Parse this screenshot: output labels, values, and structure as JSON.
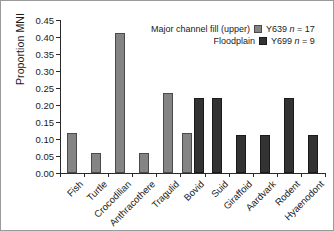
{
  "chart_data": {
    "type": "bar",
    "title": "",
    "xlabel": "",
    "ylabel": "Proportion MNI",
    "ylim": [
      0,
      0.45
    ],
    "ytick_step": 0.05,
    "ytick_labels": [
      "0.00",
      "0.05",
      "0.10",
      "0.15",
      "0.20",
      "0.25",
      "0.30",
      "0.35",
      "0.40",
      "0.45"
    ],
    "grid": false,
    "legend_position": "top-right",
    "categories": [
      "Fish",
      "Turtle",
      "Crocodilian",
      "Anthracothere",
      "Tragulid",
      "Bovid",
      "Suid",
      "Giraffoid",
      "Aardvark",
      "Rodent",
      "Hyaenodont"
    ],
    "series": [
      {
        "name": "Y639",
        "description": "Major channel fill (upper)",
        "n_label": "n = 17",
        "n": 17,
        "color": "#848484",
        "values": [
          0.118,
          0.059,
          0.412,
          0.059,
          0.235,
          0.118,
          0.0,
          0.0,
          0.0,
          0.0,
          0.0
        ]
      },
      {
        "name": "Y699",
        "description": "Floodplain",
        "n_label": "n = 9",
        "n": 9,
        "color": "#333333",
        "values": [
          0.0,
          0.0,
          0.0,
          0.0,
          0.0,
          0.222,
          0.222,
          0.111,
          0.111,
          0.222,
          0.111
        ]
      }
    ]
  },
  "legend": {
    "rows": [
      {
        "desc": "Major channel fill (upper)",
        "key": "Y639",
        "n": "n",
        "eq": " = 17",
        "swatch": "s1"
      },
      {
        "desc": "Floodplain",
        "key": "Y699",
        "n": "n",
        "eq": " = 9",
        "swatch": "s2"
      }
    ]
  }
}
